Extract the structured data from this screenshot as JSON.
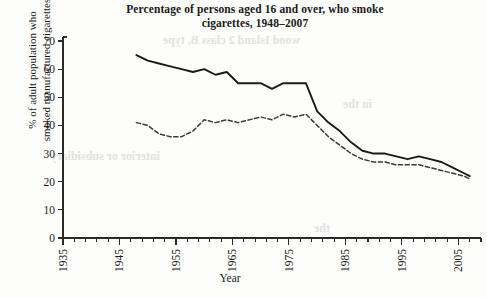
{
  "chart_data": {
    "type": "line",
    "title": "Percentage of persons aged 16 and over, who smoke cigarettes, 1948–2007",
    "title_line1": "Percentage of persons aged 16 and over, who smoke",
    "title_line2": "cigarettes, 1948–2007",
    "xlabel": "Year",
    "ylabel": "% of adult population who smoked manufactured cigarettes",
    "ylabel_line1": "% of adult population who",
    "ylabel_line2": "smoked manufactured cigarettes",
    "xlim": [
      1935,
      2009
    ],
    "ylim": [
      0,
      70
    ],
    "y_ticks": [
      0,
      10,
      20,
      30,
      40,
      50,
      60,
      70
    ],
    "y_tick_labels": [
      "0",
      "10",
      "20",
      "30",
      "40",
      "50",
      "60",
      "70"
    ],
    "x_ticks_major": [
      1935,
      1945,
      1955,
      1965,
      1975,
      1985,
      1995,
      2005
    ],
    "x_tick_labels": [
      "1935",
      "1945",
      "1955",
      "1965",
      "1975",
      "1985",
      "1995",
      "2005"
    ],
    "x_minor_tick_step": 2,
    "grid": false,
    "legend": false,
    "legend_position": "none",
    "series": [
      {
        "name": "men",
        "style": "solid",
        "color": "#1a1a1a",
        "x": [
          1948,
          1950,
          1952,
          1954,
          1956,
          1958,
          1960,
          1962,
          1964,
          1966,
          1968,
          1970,
          1972,
          1974,
          1976,
          1978,
          1980,
          1982,
          1984,
          1986,
          1988,
          1990,
          1992,
          1994,
          1996,
          1998,
          2000,
          2002,
          2004,
          2006,
          2007
        ],
        "values": [
          65,
          63,
          62,
          61,
          60,
          59,
          60,
          58,
          59,
          55,
          55,
          55,
          53,
          55,
          55,
          55,
          45,
          41,
          38,
          34,
          31,
          30,
          30,
          29,
          28,
          29,
          28,
          27,
          25,
          23,
          22
        ]
      },
      {
        "name": "women",
        "style": "dashed",
        "color": "#3a3a3a",
        "x": [
          1948,
          1950,
          1952,
          1954,
          1956,
          1958,
          1960,
          1962,
          1964,
          1966,
          1968,
          1970,
          1972,
          1974,
          1976,
          1978,
          1980,
          1982,
          1984,
          1986,
          1988,
          1990,
          1992,
          1994,
          1996,
          1998,
          2000,
          2002,
          2004,
          2006,
          2007
        ],
        "values": [
          41,
          40,
          37,
          36,
          36,
          38,
          42,
          41,
          42,
          41,
          42,
          43,
          42,
          44,
          43,
          44,
          40,
          36,
          33,
          30,
          28,
          27,
          27,
          26,
          26,
          26,
          25,
          24,
          23,
          22,
          21
        ]
      }
    ]
  },
  "bleedthrough": [
    {
      "text": "wood Island 2 class B, type",
      "x": 300,
      "y": 44
    },
    {
      "text": "in the",
      "x": 372,
      "y": 108
    },
    {
      "text": "interior or subsidiary",
      "x": 160,
      "y": 160
    },
    {
      "text": "the",
      "x": 330,
      "y": 232
    }
  ]
}
